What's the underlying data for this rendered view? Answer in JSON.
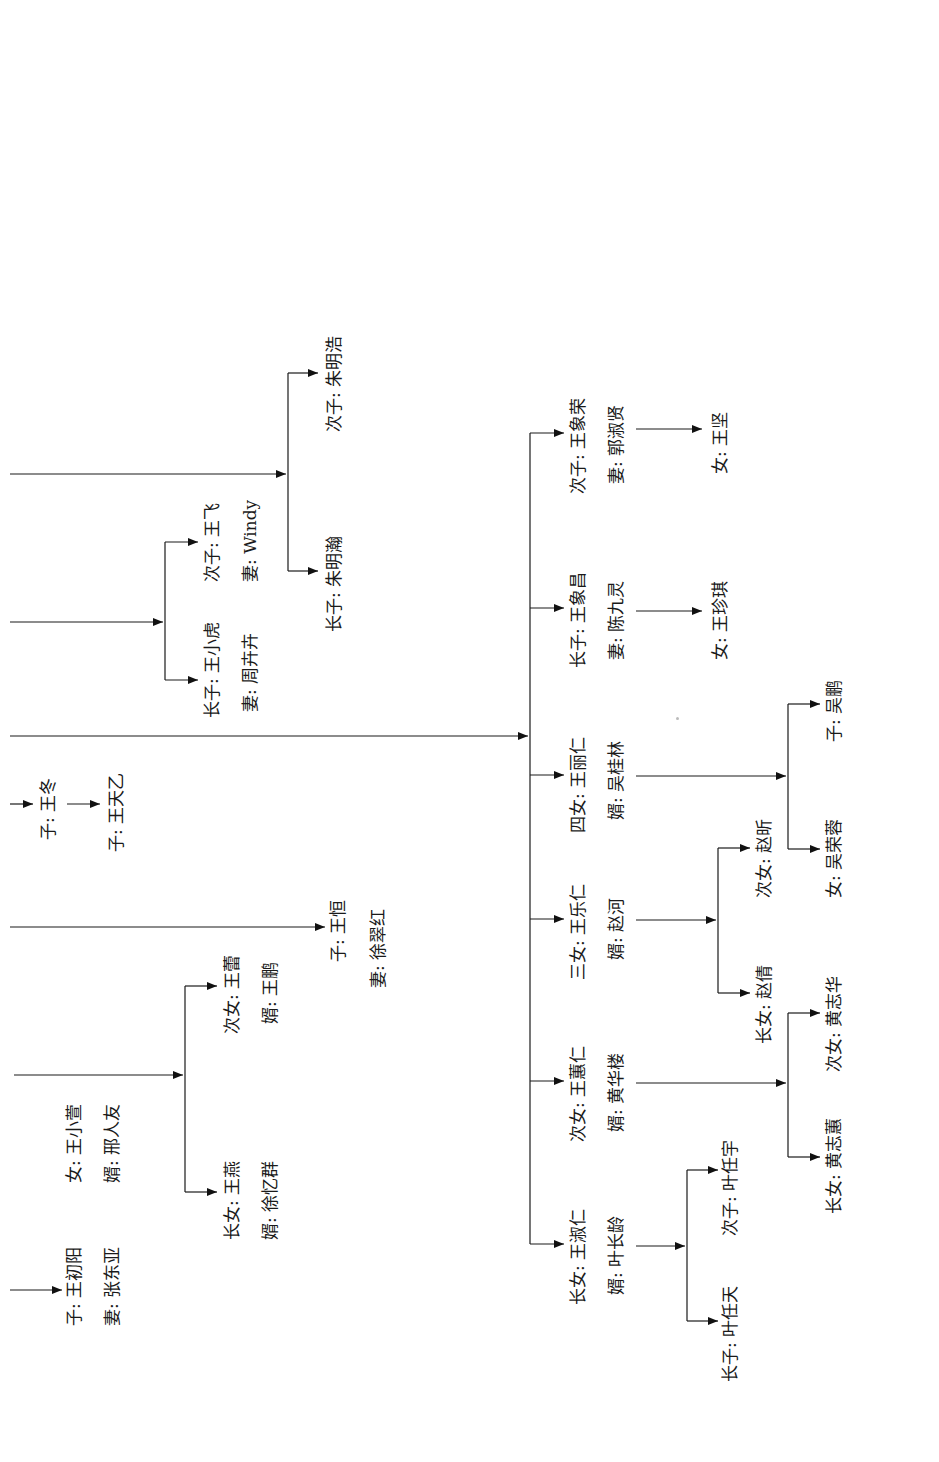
{
  "diagram": {
    "type": "family-tree",
    "orientation": "rotated-90-ccw",
    "colors": {
      "line": "#1a1a1a",
      "background": "#ffffff"
    }
  },
  "labels": {
    "wang_chuyang": "子: 王初阳",
    "wang_chuyang_wife": "妻: 张东亚",
    "wang_xiaoxuan": "女: 王小萱",
    "wang_xiaoxuan_husband": "婿: 邢人友",
    "wang_yan": "长女: 王燕",
    "wang_yan_husband": "婿: 徐忆群",
    "wang_lei": "次女: 王蕾",
    "wang_lei_husband": "婿: 王鹏",
    "wang_heng": "子: 王恒",
    "wang_heng_wife": "妻: 徐翠红",
    "wang_dong": "子: 王冬",
    "wang_tianyi": "子: 王天乙",
    "wang_xiaohu": "长子: 王小虎",
    "wang_xiaohu_wife": "妻: 周卉卉",
    "wang_fei": "次子: 王飞",
    "wang_fei_wife": "妻: Windy",
    "zhu_minghan": "长子: 朱明瀚",
    "zhu_minghao": "次子: 朱明浩",
    "wang_shuren": "长女: 王淑仁",
    "wang_shuren_husband": "婿: 叶长龄",
    "ye_rentian": "长子: 叶任天",
    "ye_renyu": "次子: 叶任宇",
    "wang_huiren": "次女: 王蕙仁",
    "wang_huiren_husband": "婿: 黄华楼",
    "huang_zhihui": "长女: 黄志蕙",
    "huang_zhihua": "次女: 黄志华",
    "wang_leren": "三女: 王乐仁",
    "wang_leren_husband": "婿: 赵河",
    "zhao_qian": "长女: 赵倩",
    "zhao_xin": "次女: 赵昕",
    "wang_liren": "四女: 王丽仁",
    "wang_liren_husband": "婿: 吴桂林",
    "wu_rongrong": "女: 吴荣蓉",
    "wu_peng": "子: 吴鹏",
    "wang_xiangchang": "长子: 王象昌",
    "wang_xiangchang_wife": "妻: 陈九灵",
    "wang_zhenqi": "女: 王珍琪",
    "wang_xiangrong": "次子: 王象荣",
    "wang_xiangrong_wife": "妻: 郭淑贤",
    "wang_jian": "女: 王坚"
  }
}
